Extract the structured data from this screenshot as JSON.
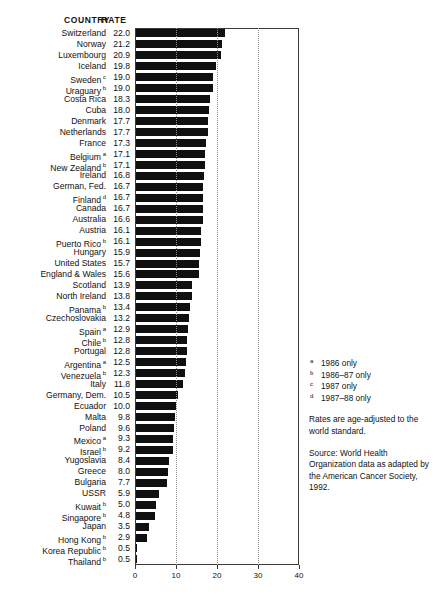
{
  "header": {
    "country_label": "COUNTRY",
    "rate_label": "RATE"
  },
  "axis": {
    "ticks": [
      "0",
      "10",
      "20",
      "30",
      "40"
    ]
  },
  "footnotes": [
    {
      "marker": "a",
      "text": "1986 only"
    },
    {
      "marker": "b",
      "text": "1986–87 only"
    },
    {
      "marker": "c",
      "text": "1987 only"
    },
    {
      "marker": "d",
      "text": "1987–88 only"
    }
  ],
  "note_rates": "Rates are age-adjusted to the world standard.",
  "note_source": "Source: World Health Organization data as adapted by the American Cancer Society, 1992.",
  "colors": {
    "bar": "#101010",
    "frame": "#3a3a3a",
    "gridline": "#8d8d8d",
    "text": "#111111"
  },
  "chart_data": {
    "type": "bar",
    "orientation": "horizontal",
    "title": "",
    "xlabel": "",
    "ylabel": "",
    "xlim": [
      0,
      40
    ],
    "xticks": [
      0,
      10,
      20,
      30,
      40
    ],
    "gridlines_x": [
      10,
      20,
      30
    ],
    "grid": true,
    "legend": false,
    "categories": [
      "Switzerland",
      "Norway",
      "Luxembourg",
      "Iceland",
      "Sweden",
      "Uraguary",
      "Costa Rica",
      "Cuba",
      "Denmark",
      "Netherlands",
      "France",
      "Belgium",
      "New Zealand",
      "Ireland",
      "German, Fed.",
      "Finland",
      "Canada",
      "Australia",
      "Austria",
      "Puerto Rico",
      "Hungary",
      "United States",
      "England & Wales",
      "Scotland",
      "North Ireland",
      "Panama",
      "Czechoslovakia",
      "Spain",
      "Chile",
      "Portugal",
      "Argentina",
      "Venezuela",
      "Italy",
      "Germany, Dem.",
      "Ecuador",
      "Malta",
      "Poland",
      "Mexico",
      "Israel",
      "Yugoslavia",
      "Greece",
      "Bulgaria",
      "USSR",
      "Kuwait",
      "Singapore",
      "Japan",
      "Hong Kong",
      "Korea Republic",
      "Thailand"
    ],
    "markers": [
      "",
      "",
      "",
      "",
      "c",
      "b",
      "",
      "",
      "",
      "",
      "",
      "a",
      "b",
      "",
      "",
      "d",
      "",
      "",
      "",
      "b",
      "",
      "",
      "",
      "",
      "",
      "b",
      "",
      "a",
      "b",
      "",
      "a",
      "b",
      "",
      "",
      "",
      "",
      "",
      "a",
      "b",
      "",
      "",
      "",
      "",
      "b",
      "b",
      "",
      "b",
      "b",
      "b"
    ],
    "values": [
      22.0,
      21.2,
      20.9,
      19.8,
      19.0,
      19.0,
      18.3,
      18.0,
      17.7,
      17.7,
      17.3,
      17.1,
      17.1,
      16.8,
      16.7,
      16.7,
      16.7,
      16.6,
      16.1,
      16.1,
      15.9,
      15.7,
      15.6,
      13.9,
      13.8,
      13.4,
      13.2,
      12.9,
      12.8,
      12.8,
      12.5,
      12.3,
      11.8,
      10.5,
      10.0,
      9.8,
      9.6,
      9.3,
      9.2,
      8.4,
      8.0,
      7.7,
      5.9,
      5.0,
      4.8,
      3.5,
      2.9,
      0.5,
      0.5
    ],
    "value_labels": [
      "22.0",
      "21.2",
      "20.9",
      "19.8",
      "19.0",
      "19.0",
      "18.3",
      "18.0",
      "17.7",
      "17.7",
      "17.3",
      "17.1",
      "17.1",
      "16.8",
      "16.7",
      "16.7",
      "16.7",
      "16.6",
      "16.1",
      "16.1",
      "15.9",
      "15.7",
      "15.6",
      "13.9",
      "13.8",
      "13.4",
      "13.2",
      "12.9",
      "12.8",
      "12.8",
      "12.5",
      "12.3",
      "11.8",
      "10.5",
      "10.0",
      "9.8",
      "9.6",
      "9.3",
      "9.2",
      "8.4",
      "8.0",
      "7.7",
      "5.9",
      "5.0",
      "4.8",
      "3.5",
      "2.9",
      "0.5",
      "0.5"
    ]
  }
}
